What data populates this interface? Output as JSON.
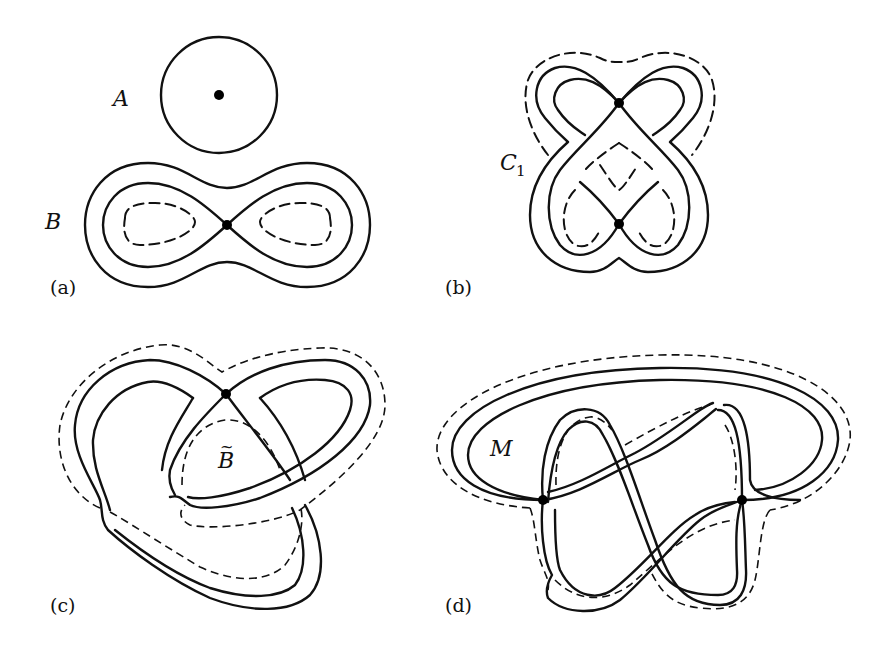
{
  "figure": {
    "panels": [
      {
        "id": "a",
        "label": "(a)",
        "regions": [
          {
            "name": "A",
            "text": "A"
          },
          {
            "name": "B",
            "text": "B"
          }
        ]
      },
      {
        "id": "b",
        "label": "(b)",
        "regions": [
          {
            "name": "C1",
            "text": "C",
            "subscript": "1"
          }
        ]
      },
      {
        "id": "c",
        "label": "(c)",
        "regions": [
          {
            "name": "B-tilde",
            "text": "B",
            "accent": "~"
          }
        ]
      },
      {
        "id": "d",
        "label": "(d)",
        "regions": [
          {
            "name": "M",
            "text": "M"
          }
        ]
      }
    ],
    "colors": {
      "ink": "#111111",
      "background": "#ffffff"
    }
  }
}
